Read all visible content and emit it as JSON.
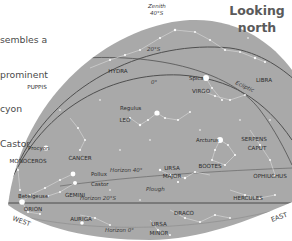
{
  "caption": {
    "lines": [
      "sembles a",
      "prominent",
      "cyon",
      "Castor"
    ]
  },
  "title": {
    "line1": "Looking",
    "line2": "north"
  },
  "colors": {
    "dome": "#a9a9a9",
    "star": "#ffffff",
    "line": "#d8d8d8",
    "arc": "#4a4a4a",
    "label": "#2b2b2b"
  },
  "sky_labels": {
    "zenith": "Zenith",
    "zenith_alt": "40°S",
    "dec20": "20°S",
    "dec0": "0°",
    "ecliptic": "Ecliptic",
    "horizon40": "Horizon 40°",
    "horizon20": "Horizon 20°S",
    "horizon0": "Horizon 0°",
    "plough": "Plough",
    "west": "WEST",
    "east": "EAST"
  },
  "constellations": [
    {
      "name": "HYDRA",
      "x": 118,
      "y": 73
    },
    {
      "name": "PUPPIS",
      "x": 37,
      "y": 89
    },
    {
      "name": "VIRGO",
      "x": 201,
      "y": 93
    },
    {
      "name": "LIBRA",
      "x": 264,
      "y": 82
    },
    {
      "name": "LEO",
      "x": 125,
      "y": 122
    },
    {
      "name": "CANCER",
      "x": 80,
      "y": 160
    },
    {
      "name": "MONOCEROS",
      "x": 28,
      "y": 163
    },
    {
      "name": "SERPENS",
      "x": 254,
      "y": 141
    },
    {
      "name": "CAPUT",
      "x": 257,
      "y": 150
    },
    {
      "name": "OPHIUCHUS",
      "x": 270,
      "y": 178
    },
    {
      "name": "BOOTES",
      "x": 210,
      "y": 168
    },
    {
      "name": "URSA",
      "x": 172,
      "y": 170
    },
    {
      "name": "MAJOR",
      "x": 172,
      "y": 178
    },
    {
      "name": "GEMINI",
      "x": 75,
      "y": 197
    },
    {
      "name": "HERCULES",
      "x": 248,
      "y": 200
    },
    {
      "name": "ORION",
      "x": 33,
      "y": 211
    },
    {
      "name": "AURIGA",
      "x": 81,
      "y": 221
    },
    {
      "name": "DRACO",
      "x": 184,
      "y": 215
    },
    {
      "name": "URSA",
      "x": 159,
      "y": 226
    },
    {
      "name": "MINOR",
      "x": 159,
      "y": 235
    }
  ],
  "bright_stars": [
    {
      "name": "Spica",
      "x": 206,
      "y": 78,
      "label_x": 189,
      "label_y": 80,
      "r": 3
    },
    {
      "name": "Regulus",
      "x": 157,
      "y": 113,
      "label_x": 120,
      "label_y": 110,
      "r": 2.6
    },
    {
      "name": "Procyon",
      "x": 46,
      "y": 148,
      "label_x": 28,
      "label_y": 150,
      "r": 2.6
    },
    {
      "name": "Arcturus",
      "x": 220,
      "y": 140,
      "label_x": 196,
      "label_y": 142,
      "r": 3
    },
    {
      "name": "Pollux",
      "x": 73,
      "y": 174,
      "label_x": 91,
      "label_y": 176,
      "r": 2.4
    },
    {
      "name": "Castor",
      "x": 75,
      "y": 183,
      "label_x": 91,
      "label_y": 186,
      "r": 2
    },
    {
      "name": "Betelgeuse",
      "x": 22,
      "y": 202,
      "label_x": 18,
      "label_y": 198,
      "r": 2.8
    }
  ]
}
